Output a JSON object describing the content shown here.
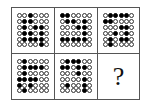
{
  "puzzle": {
    "rows": 2,
    "cols": 3,
    "grid_size": [
      6,
      6
    ],
    "colors": {
      "filled": "#000000",
      "empty": "#ffffff",
      "border": "#555555"
    },
    "cells": [
      {
        "pattern": [
          "001000",
          "011000",
          "010110",
          "011010",
          "011110",
          "000010"
        ]
      },
      {
        "pattern": [
          "110000",
          "011010",
          "000110",
          "000010",
          "111110",
          "000000"
        ]
      },
      {
        "pattern": [
          "011110",
          "110000",
          "000110",
          "001010",
          "010110",
          "010000"
        ]
      },
      {
        "pattern": [
          "010000",
          "011110",
          "010000",
          "111100",
          "101000",
          "010000"
        ]
      },
      {
        "pattern": [
          "011100",
          "110110",
          "000100",
          "000010",
          "010010",
          "000010"
        ]
      }
    ],
    "answer_placeholder": "?"
  }
}
